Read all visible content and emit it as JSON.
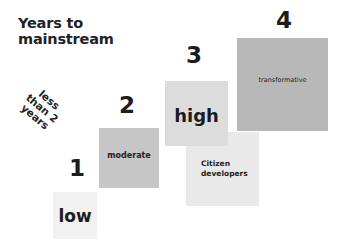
{
  "title": {
    "line1": "Years to",
    "line2": "mainstream"
  },
  "rotated_label": {
    "line1": "less",
    "line2": "than 2",
    "line3": "years"
  },
  "steps": [
    {
      "number": "1",
      "label": "low",
      "color": "#f1f1f1"
    },
    {
      "number": "2",
      "label": "moderate",
      "color": "#c6c6c6"
    },
    {
      "number": "3",
      "label": "high",
      "color": "#dcdcdc"
    },
    {
      "number": "4",
      "label": "transformative",
      "color": "#b8b8b8"
    }
  ],
  "citizen_box": {
    "line1": "Citizen",
    "line2": "developers",
    "color": "#e9e9e9"
  }
}
